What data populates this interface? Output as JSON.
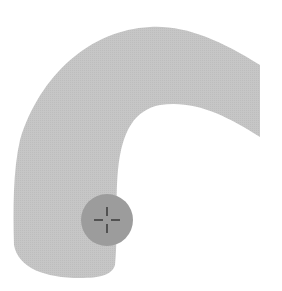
{
  "canvas": {
    "background": "#ffffff",
    "shape_color": "#c3c3c3",
    "handle_color": "#9c9c9c",
    "crosshair_color": "#2a2a2a"
  },
  "shape": {
    "kind": "curved-band",
    "label": ""
  },
  "handle": {
    "kind": "drag-handle",
    "icon": "crosshair-icon"
  }
}
